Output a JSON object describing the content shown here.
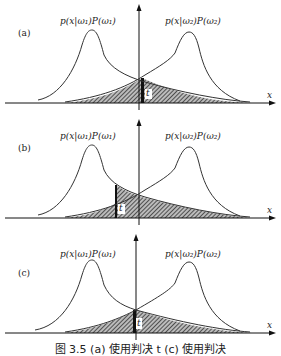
{
  "figure": {
    "panels": [
      {
        "id": "a",
        "label": "(a)",
        "class1_label": "p(x|ω₁)P(ω₁)",
        "class2_label": "p(x|ω₂)P(ω₂)",
        "threshold_label": "t",
        "x_axis_label": "x",
        "threshold_position": "right-of-intersection"
      },
      {
        "id": "b",
        "label": "(b)",
        "class1_label": "p(x|ω₁)P(ω₁)",
        "class2_label": "p(x|ω₂)P(ω₂)",
        "threshold_label": "t",
        "x_axis_label": "x",
        "threshold_position": "left-of-intersection"
      },
      {
        "id": "c",
        "label": "(c)",
        "class1_label": "p(x|ω₁)P(ω₁)",
        "class2_label": "p(x|ω₂)P(ω₂)",
        "threshold_label": "t",
        "x_axis_label": "x",
        "threshold_position": "at-intersection"
      }
    ],
    "caption": "图 3.5   (a) 使用判决 t        (c) 使用判决"
  }
}
